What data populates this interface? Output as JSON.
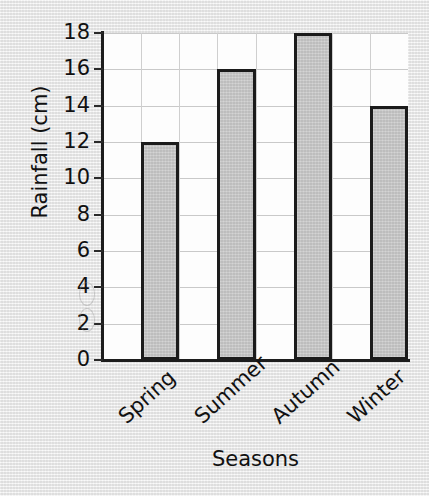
{
  "chart_data": {
    "type": "bar",
    "title": "",
    "categories": [
      "Spring",
      "Summer",
      "Autumn",
      "Winter"
    ],
    "values": [
      12,
      16,
      18,
      14
    ],
    "xlabel": "Seasons",
    "ylabel": "Rainfall (cm)",
    "ylim": [
      0,
      18
    ],
    "ytick_labels": [
      "0",
      "2",
      "4",
      "6",
      "8",
      "10",
      "12",
      "14",
      "16",
      "18"
    ],
    "ytick_values": [
      0,
      2,
      4,
      6,
      8,
      10,
      12,
      14,
      16,
      18
    ],
    "ytick_step": 2,
    "grid": true,
    "legend": "none",
    "bar_fill_color": "#c2c2c2",
    "bar_border_color": "#1b1b1b",
    "axis_color": "#1d1d1d",
    "gridline_color": "#c9c9c9",
    "plot_background_color": "#fdfdfd",
    "page_background_color": "#ececec"
  },
  "axes": {
    "y_title": "Rainfall (cm)",
    "x_title": "Seasons"
  },
  "ticks": {
    "y": [
      "18",
      "16",
      "14",
      "12",
      "10",
      "8",
      "6",
      "4",
      "2",
      "0"
    ]
  },
  "categories": {
    "spring": "Spring",
    "summer": "Summer",
    "autumn": "Autumn",
    "winter": "Winter"
  }
}
